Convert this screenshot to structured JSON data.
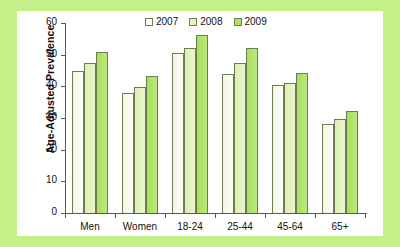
{
  "chart_data": {
    "type": "bar",
    "title": "",
    "xlabel": "",
    "ylabel": "Age-Adjusted Prevalence",
    "categories": [
      "Men",
      "Women",
      "18-24",
      "25-44",
      "45-64",
      "65+"
    ],
    "series": [
      {
        "name": "2007",
        "color": "#fbfdf4",
        "values": [
          45.0,
          38.0,
          50.5,
          44.0,
          40.3,
          28.2
        ]
      },
      {
        "name": "2008",
        "color": "#e5f4c2",
        "values": [
          47.4,
          39.7,
          52.2,
          47.4,
          41.0,
          29.8
        ]
      },
      {
        "name": "2009",
        "color": "#aee267",
        "values": [
          51.0,
          43.3,
          56.2,
          52.0,
          44.2,
          32.1
        ]
      }
    ],
    "ylim": [
      0,
      60
    ],
    "yticks": [
      0,
      10,
      20,
      30,
      40,
      50,
      60
    ],
    "ytick_labels": [
      "0",
      "10",
      "20",
      "30",
      "40",
      "50",
      "60"
    ],
    "grid": false,
    "legend_position": "top-center",
    "legend_entries": [
      "2007",
      "2008",
      "2009"
    ],
    "background_color": "#c4f08a",
    "panel_color": "#ffffff",
    "axis_color": "#55595a"
  }
}
